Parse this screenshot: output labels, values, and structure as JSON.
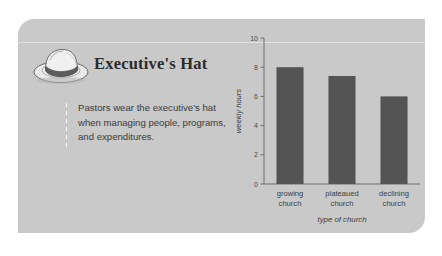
{
  "card": {
    "background_color": "#c9c9c9"
  },
  "header": {
    "icon": "executive-hat-icon",
    "title": "Executive's Hat"
  },
  "body": {
    "text": "Pastors wear the executive's hat when managing people, programs, and expenditures."
  },
  "chart_data": {
    "type": "bar",
    "title": "",
    "categories": [
      "growing church",
      "plateaued church",
      "declining church"
    ],
    "category_lines": [
      [
        "growing",
        "church"
      ],
      [
        "plateaued",
        "church"
      ],
      [
        "declining",
        "church"
      ]
    ],
    "values": [
      8,
      7.4,
      6
    ],
    "xlabel": "type of church",
    "ylabel": "weekly hours",
    "ylim": [
      0,
      10
    ],
    "yticks": [
      0,
      2,
      4,
      6,
      8,
      10
    ],
    "ytick_labels": [
      "0",
      "2",
      "4",
      "6",
      "8",
      "10"
    ],
    "grid": false,
    "legend": false,
    "bar_color": "#545454",
    "axis_color": "#6e6e6e"
  }
}
